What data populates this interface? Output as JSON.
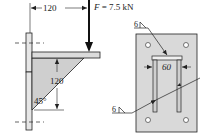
{
  "figure": {
    "side_view": {
      "horizontal_dimension": "120",
      "vertical_dimension": "120",
      "angle_label": "45°",
      "force_label_var": "F",
      "force_label_eq": " = 7.5 kN"
    },
    "front_view": {
      "width_dimension": "60",
      "weld_symbol_top": "6",
      "weld_symbol_bottom": "6"
    }
  },
  "colors": {
    "plate_fill": "#d9d9d9",
    "gusset_fill": "#cfcfcf",
    "line": "#222222",
    "background": "#ffffff"
  }
}
